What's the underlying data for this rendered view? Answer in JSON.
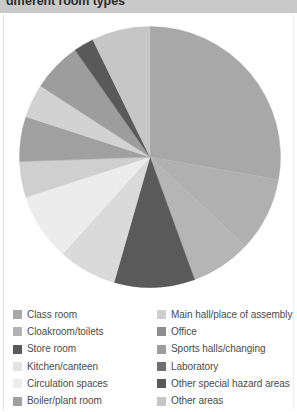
{
  "title": "different room types",
  "chart_data": {
    "type": "pie",
    "title": "different room types",
    "xlabel": "",
    "ylabel": "",
    "legend_position": "bottom",
    "grid": false,
    "start_angle_deg": 0,
    "direction": "clockwise",
    "categories": [
      "Class room",
      "Main hall/place of assembly",
      "Cloakroom/toilets",
      "Office",
      "Store room",
      "Sports halls/changing",
      "Kitchen/canteen",
      "Laboratory",
      "Circulation spaces",
      "Other special hazard areas",
      "Boiler/plant room",
      "Other areas"
    ],
    "values": [
      28,
      9,
      8,
      5,
      9,
      6,
      5,
      7,
      9,
      2,
      6,
      6
    ],
    "colors": [
      "#a8a8a8",
      "#c6c6c6",
      "#9d9d9d",
      "#8f8f8f",
      "#5a5a5a",
      "#acacac",
      "#e3e3e3",
      "#6f6f6f",
      "#ececec",
      "#595959",
      "#a0a0a0",
      "#cfcfcf"
    ],
    "slices": [
      {
        "label": "Class room",
        "value": 28,
        "color": "#a8a8a8",
        "start_deg": 0,
        "end_deg": 100
      },
      {
        "label": "Main hall/place of assembly",
        "value": 9,
        "color": "#b0b0b0",
        "start_deg": 100,
        "end_deg": 133
      },
      {
        "label": "Office",
        "value": 5,
        "color": "#b5b5b5",
        "start_deg": 133,
        "end_deg": 160
      },
      {
        "label": "Store room",
        "value": 9,
        "color": "#5a5a5a",
        "start_deg": 160,
        "end_deg": 196
      },
      {
        "label": "Kitchen/canteen",
        "value": 5,
        "color": "#dadada",
        "start_deg": 196,
        "end_deg": 222
      },
      {
        "label": "Circulation spaces",
        "value": 9,
        "color": "#ececec",
        "start_deg": 222,
        "end_deg": 252
      },
      {
        "label": "Other areas",
        "value": 6,
        "color": "#cfcfcf",
        "start_deg": 252,
        "end_deg": 268
      },
      {
        "label": "Boiler/plant room",
        "value": 6,
        "color": "#a0a0a0",
        "start_deg": 268,
        "end_deg": 288
      },
      {
        "label": "Cloakroom/toilets",
        "value": 8,
        "color": "#d2d2d2",
        "start_deg": 288,
        "end_deg": 303
      },
      {
        "label": "Sports halls/changing",
        "value": 6,
        "color": "#9d9d9d",
        "start_deg": 303,
        "end_deg": 325
      },
      {
        "label": "Other special hazard areas",
        "value": 2,
        "color": "#595959",
        "start_deg": 325,
        "end_deg": 334
      },
      {
        "label": "Laboratory",
        "value": 7,
        "color": "#c6c6c6",
        "start_deg": 334,
        "end_deg": 360
      }
    ]
  },
  "legend": {
    "left_column": [
      {
        "label": "Class room",
        "color": "#a8a8a8"
      },
      {
        "label": "Cloakroom/toilets",
        "color": "#b3b3b3"
      },
      {
        "label": "Store room",
        "color": "#5a5a5a"
      },
      {
        "label": "Kitchen/canteen",
        "color": "#e3e3e3"
      },
      {
        "label": "Circulation spaces",
        "color": "#ececec"
      },
      {
        "label": "Boiler/plant room",
        "color": "#a0a0a0"
      }
    ],
    "right_column": [
      {
        "label": "Main hall/place of assembly",
        "color": "#cfcfcf"
      },
      {
        "label": "Office",
        "color": "#8f8f8f"
      },
      {
        "label": "Sports halls/changing",
        "color": "#9d9d9d"
      },
      {
        "label": "Laboratory",
        "color": "#6f6f6f"
      },
      {
        "label": "Other special hazard areas",
        "color": "#595959"
      },
      {
        "label": "Other areas",
        "color": "#c6c6c6"
      }
    ]
  }
}
